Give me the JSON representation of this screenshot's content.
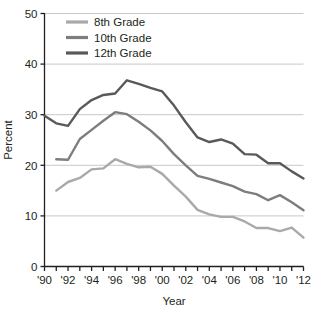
{
  "chart_data": {
    "type": "line",
    "title": "",
    "xlabel": "Year",
    "ylabel": "Percent",
    "xlim": [
      1990,
      2012
    ],
    "ylim": [
      0,
      50
    ],
    "ytick_labels": [
      "0",
      "10",
      "20",
      "30",
      "40",
      "50"
    ],
    "yticks": [
      0,
      10,
      20,
      30,
      40,
      50
    ],
    "xtick_labels": [
      "'90",
      "'92",
      "'94",
      "'96",
      "'98",
      "'00",
      "'02",
      "'04",
      "'06",
      "'08",
      "'10",
      "'12"
    ],
    "xticks": [
      1990,
      1992,
      1994,
      1996,
      1998,
      2000,
      2002,
      2004,
      2006,
      2008,
      2010,
      2012
    ],
    "minor_xticks": [
      1991,
      1993,
      1995,
      1997,
      1999,
      2001,
      2003,
      2005,
      2007,
      2009,
      2011
    ],
    "grid": "horizontal",
    "legend_position": "top-left-inside",
    "series": [
      {
        "name": "8th Grade",
        "color": "#a9a9a9",
        "x": [
          1991,
          1992,
          1993,
          1994,
          1995,
          1996,
          1997,
          1998,
          1999,
          2000,
          2001,
          2002,
          2003,
          2004,
          2005,
          2006,
          2007,
          2008,
          2009,
          2010,
          2011,
          2012
        ],
        "values": [
          15.0,
          16.7,
          17.5,
          19.2,
          19.4,
          21.2,
          20.3,
          19.6,
          19.7,
          18.3,
          16.0,
          13.8,
          11.2,
          10.3,
          9.8,
          9.8,
          8.9,
          7.6,
          7.6,
          7.0,
          7.7,
          6.4
        ],
        "end_value": 5.7
      },
      {
        "name": "10th Grade",
        "color": "#7d7d7d",
        "x": [
          1991,
          1992,
          1993,
          1994,
          1995,
          1996,
          1997,
          1998,
          1999,
          2000,
          2001,
          2002,
          2003,
          2004,
          2005,
          2006,
          2007,
          2008,
          2009,
          2010,
          2011,
          2012
        ],
        "values": [
          21.2,
          21.1,
          25.2,
          27.0,
          28.8,
          30.5,
          30.1,
          28.6,
          26.9,
          24.8,
          22.2,
          20.0,
          17.9,
          17.3,
          16.6,
          15.9,
          14.8,
          14.3,
          13.1,
          14.1,
          12.7,
          11.8
        ],
        "end_value": 11.1
      },
      {
        "name": "12th Grade",
        "color": "#595959",
        "x": [
          1990,
          1991,
          1992,
          1993,
          1994,
          1995,
          1996,
          1997,
          1998,
          1999,
          2000,
          2001,
          2002,
          2003,
          2004,
          2005,
          2006,
          2007,
          2008,
          2009,
          2010,
          2011,
          2012
        ],
        "values": [
          29.8,
          28.3,
          27.8,
          31.1,
          32.9,
          33.9,
          34.2,
          36.8,
          36.1,
          35.3,
          34.6,
          31.8,
          28.5,
          25.5,
          24.6,
          25.1,
          24.3,
          22.2,
          22.1,
          20.4,
          20.4,
          18.8,
          17.4
        ],
        "end_value": 17.4
      }
    ]
  },
  "legend": {
    "items": [
      {
        "label": "8th Grade"
      },
      {
        "label": "10th Grade"
      },
      {
        "label": "12th Grade"
      }
    ]
  },
  "axes": {
    "y_title": "Percent",
    "x_title": "Year"
  },
  "colors": {
    "axis": "#231f20",
    "grid": "#c8c8c8",
    "background": "#ffffff"
  }
}
